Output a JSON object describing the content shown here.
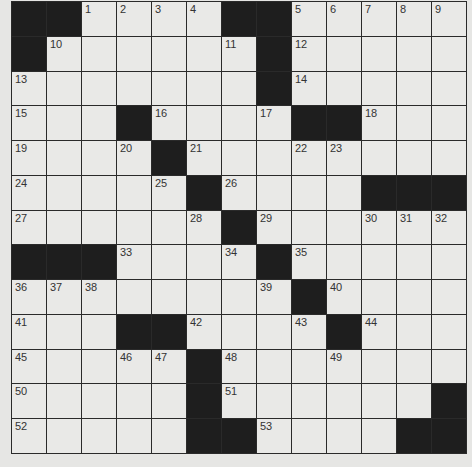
{
  "puzzle": {
    "rows": 13,
    "cols": 13,
    "grid": [
      [
        "#",
        "#",
        "1",
        "2",
        "3",
        "4",
        "#",
        "#",
        "5",
        "6",
        "7",
        "8",
        "9"
      ],
      [
        "#",
        "10",
        ".",
        ".",
        ".",
        ".",
        "11",
        "#",
        "12",
        ".",
        ".",
        ".",
        "."
      ],
      [
        "13",
        ".",
        ".",
        ".",
        ".",
        ".",
        ".",
        "#",
        "14",
        ".",
        ".",
        ".",
        "."
      ],
      [
        "15",
        ".",
        ".",
        "#",
        "16",
        ".",
        ".",
        "17",
        "#",
        "#",
        "18",
        ".",
        "."
      ],
      [
        "19",
        ".",
        ".",
        "20",
        "#",
        "21",
        ".",
        ".",
        "22",
        "23",
        ".",
        ".",
        "."
      ],
      [
        "24",
        ".",
        ".",
        ".",
        "25",
        "#",
        "26",
        ".",
        ".",
        ".",
        "#",
        "#",
        "#"
      ],
      [
        "27",
        ".",
        ".",
        ".",
        ".",
        "28",
        "#",
        "29",
        ".",
        ".",
        "30",
        "31",
        "32"
      ],
      [
        "#",
        "#",
        "#",
        "33",
        ".",
        ".",
        "34",
        "#",
        "35",
        ".",
        ".",
        ".",
        "."
      ],
      [
        "36",
        "37",
        "38",
        ".",
        ".",
        ".",
        ".",
        "39",
        "#",
        "40",
        ".",
        ".",
        "."
      ],
      [
        "41",
        ".",
        ".",
        "#",
        "#",
        "42",
        ".",
        ".",
        "43",
        "#",
        "44",
        ".",
        "."
      ],
      [
        "45",
        ".",
        ".",
        "46",
        "47",
        "#",
        "48",
        ".",
        ".",
        "49",
        ".",
        ".",
        "."
      ],
      [
        "50",
        ".",
        ".",
        ".",
        ".",
        "#",
        "51",
        ".",
        ".",
        ".",
        ".",
        ".",
        "#"
      ],
      [
        "52",
        ".",
        ".",
        ".",
        ".",
        "#",
        "#",
        "53",
        ".",
        ".",
        ".",
        "#",
        "#"
      ]
    ],
    "legend": {
      "#": "black square",
      ".": "empty white square",
      "number": "numbered white square"
    },
    "colors": {
      "block": "#1e1e1e",
      "cell": "#e9e9e7",
      "grid_line": "#2a2a2a",
      "background": "#e6e6e4"
    }
  }
}
